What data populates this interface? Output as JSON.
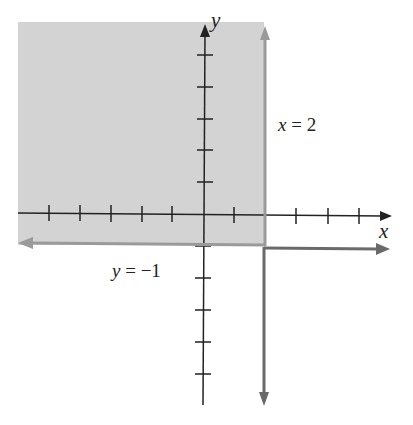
{
  "diagram": {
    "type": "inequality-region-graph",
    "axes": {
      "x_label": "x",
      "y_label": "y",
      "x_ticks": [
        -6,
        -5,
        -4,
        -3,
        -2,
        -1,
        1,
        2,
        3,
        4,
        5
      ],
      "y_ticks": [
        -5,
        -4,
        -3,
        -2,
        -1,
        1,
        2,
        3,
        4,
        5
      ]
    },
    "boundary_lines": [
      {
        "id": "vertical",
        "equation": "x = 2",
        "label_var": "x",
        "label_rest": " = 2",
        "style": "solid",
        "color": "#8a8a8a"
      },
      {
        "id": "horizontal",
        "equation": "y = -1",
        "label_var": "y",
        "label_rest": " = −1",
        "style": "solid",
        "color": "#8a8a8a"
      }
    ],
    "shaded_region": {
      "description": "x <= 2 and y >= -1",
      "color": "#d3d3d3"
    }
  }
}
